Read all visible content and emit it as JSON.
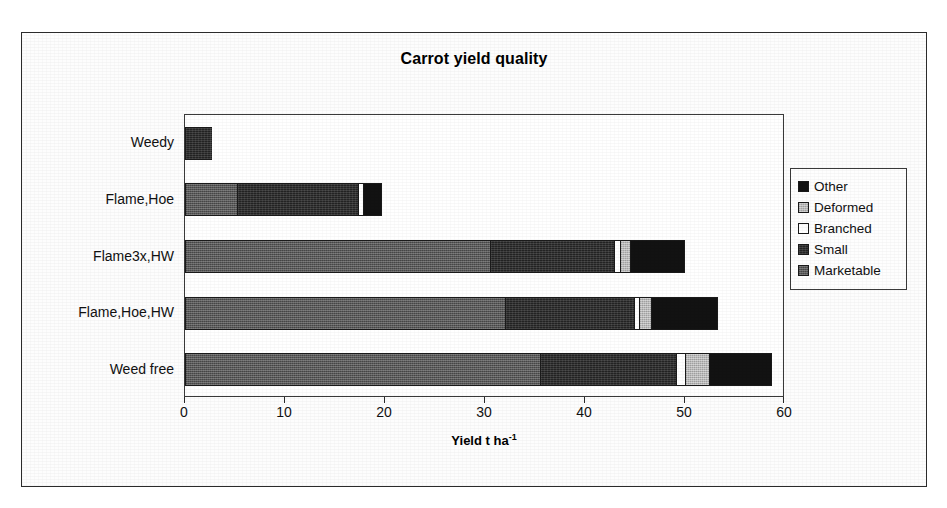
{
  "figure": {
    "title": "Carrot yield quality"
  },
  "chart_data": {
    "type": "bar",
    "orientation": "horizontal",
    "stacked": true,
    "title": "Carrot yield quality",
    "xlabel": "Yield t ha",
    "xlabel_superscript": "-1",
    "ylabel": "",
    "xlim": [
      0,
      60
    ],
    "xticks": [
      0,
      10,
      20,
      30,
      40,
      50,
      60
    ],
    "xtick_labels": [
      "0",
      "10",
      "20",
      "30",
      "40",
      "50",
      "60"
    ],
    "grid": false,
    "legend_position": "right",
    "categories": [
      "Weedy",
      "Flame,Hoe",
      "Flame3x,HW",
      "Flame,Hoe,HW",
      "Weed free"
    ],
    "series": [
      {
        "name": "Marketable",
        "color": "#595959",
        "values": [
          0.0,
          5.2,
          30.5,
          32.0,
          35.5
        ]
      },
      {
        "name": "Small",
        "color": "#232323",
        "values": [
          2.7,
          12.1,
          12.4,
          12.9,
          13.6
        ]
      },
      {
        "name": "Branched",
        "color": "#ffffff",
        "values": [
          0.0,
          0.5,
          0.6,
          0.5,
          0.9
        ]
      },
      {
        "name": "Deformed",
        "color": "#b9b9b9",
        "values": [
          0.0,
          0.0,
          1.0,
          1.2,
          2.4
        ]
      },
      {
        "name": "Other",
        "color": "#121212",
        "values": [
          0.0,
          1.9,
          5.5,
          6.7,
          6.3
        ]
      }
    ],
    "totals": [
      2.7,
      19.7,
      50.0,
      53.3,
      58.7
    ]
  },
  "legend": {
    "items": [
      {
        "label": "Other",
        "swatch": "other-swatch",
        "fill_class": "fill-other"
      },
      {
        "label": "Deformed",
        "swatch": "deformed-swatch",
        "fill_class": "fill-deformed"
      },
      {
        "label": "Branched",
        "swatch": "branched-swatch",
        "fill_class": "fill-branched"
      },
      {
        "label": "Small",
        "swatch": "small-swatch",
        "fill_class": "fill-small"
      },
      {
        "label": "Marketable",
        "swatch": "marketable-swatch",
        "fill_class": "fill-marketable"
      }
    ]
  }
}
